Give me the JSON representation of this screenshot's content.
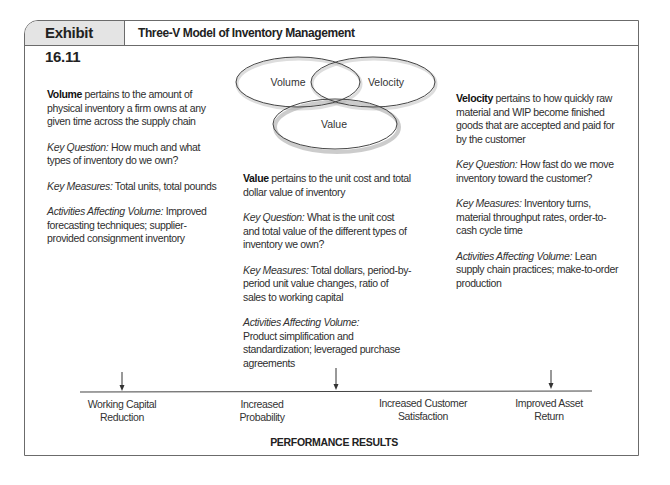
{
  "exhibit": {
    "tag": "Exhibit 16.11",
    "title": "Three-V Model of Inventory Management"
  },
  "venn": {
    "circles": [
      {
        "label": "Volume"
      },
      {
        "label": "Velocity"
      },
      {
        "label": "Value"
      }
    ]
  },
  "columns": {
    "volume": {
      "term": "Volume",
      "definition": " pertains to the amount of physical inventory a firm owns at any given time across the supply chain",
      "key_question_label": "Key Question:",
      "key_question": " How much and what types of inventory do we own?",
      "key_measures_label": "Key Measures:",
      "key_measures": " Total units, total pounds",
      "activities_label": "Activities Affecting Volume:",
      "activities": " Improved forecasting techniques; supplier-provided consignment inventory"
    },
    "value": {
      "term": "Value",
      "definition": " pertains to the unit cost and total dollar value of inventory",
      "key_question_label": "Key Question:",
      "key_question": " What is the unit cost and total value of the different types of inventory  we own?",
      "key_measures_label": "Key Measures:",
      "key_measures": " Total dollars, period-by-period unit value changes, ratio of sales to working capital",
      "activities_label": "Activities Affecting Volume:",
      "activities": "Product simplification and standardization; leveraged purchase agreements"
    },
    "velocity": {
      "term": "Velocity",
      "definition": " pertains to how quickly raw material and WIP become finished goods that are accepted and paid for by the customer",
      "key_question_label": "Key Question:",
      "key_question": " How fast do we move inventory toward the customer?",
      "key_measures_label": "Key Measures:",
      "key_measures": " Inventory turns, material throughput rates, order-to-cash cycle time",
      "activities_label": "Activities Affecting Volume:",
      "activities": " Lean supply chain practices; make-to-order production"
    }
  },
  "results": {
    "items": [
      {
        "line1": "Working Capital",
        "line2": "Reduction"
      },
      {
        "line1": "Increased",
        "line2": "Probability"
      },
      {
        "line1": "Increased Customer",
        "line2": "Satisfaction"
      },
      {
        "line1": "Improved Asset",
        "line2": "Return"
      }
    ],
    "title": "PERFORMANCE RESULTS"
  },
  "colors": {
    "border": "#6b6b6b",
    "tag_bg": "#e4e4e4",
    "text": "#2a2a2a"
  }
}
